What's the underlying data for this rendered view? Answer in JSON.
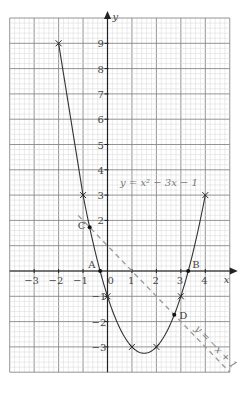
{
  "chart_data": {
    "type": "line",
    "title": "",
    "xlabel": "x",
    "ylabel": "y",
    "xlim": [
      -4,
      5
    ],
    "ylim": [
      -4,
      10
    ],
    "grid": true,
    "x_ticks": [
      "-3",
      "-2",
      "-1",
      "0",
      "1",
      "2",
      "3",
      "4"
    ],
    "y_ticks": [
      "9",
      "8",
      "7",
      "6",
      "5",
      "4",
      "3",
      "2",
      "-1",
      "-2",
      "-3"
    ],
    "series": [
      {
        "name": "y = x² − 3x − 1",
        "label": "y = x² − 3x − 1",
        "style": "solid",
        "plotted_points": [
          {
            "x": -2,
            "y": 9
          },
          {
            "x": -1,
            "y": 3
          },
          {
            "x": 0,
            "y": -1
          },
          {
            "x": 1,
            "y": -3
          },
          {
            "x": 2,
            "y": -3
          },
          {
            "x": 3,
            "y": -1
          },
          {
            "x": 4,
            "y": 3
          }
        ]
      },
      {
        "name": "y = −x + 1",
        "label": "y = −x + 1",
        "style": "dashed",
        "x_range": [
          -1.2,
          5
        ]
      }
    ],
    "annotations": [
      {
        "label": "A",
        "x": -0.3,
        "y": 0
      },
      {
        "label": "B",
        "x": 3.3,
        "y": 0
      },
      {
        "label": "C",
        "x": -0.73,
        "y": 1.73
      },
      {
        "label": "D",
        "x": 2.73,
        "y": -1.73
      }
    ]
  },
  "labels": {
    "x_axis": "x",
    "y_axis": "y",
    "curve_equation": "y = x² − 3x − 1",
    "line_equation": "y = −x + 1",
    "origin": "0"
  }
}
